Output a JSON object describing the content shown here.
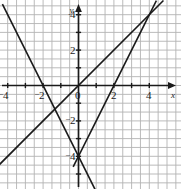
{
  "chart_data": {
    "type": "line",
    "title": "",
    "xlabel": "x",
    "ylabel": "y",
    "xlim": [
      -5,
      5
    ],
    "ylim": [
      -5.6,
      4.6
    ],
    "grid": true,
    "grid_step": 0.5,
    "legend": "none",
    "x_ticks": [
      {
        "value": -4,
        "label": "4",
        "negative": true
      },
      {
        "value": -2,
        "label": "2",
        "negative": true
      },
      {
        "value": 0,
        "label": "0",
        "negative": false
      },
      {
        "value": 2,
        "label": "2",
        "negative": false
      },
      {
        "value": 4,
        "label": "4",
        "negative": false
      }
    ],
    "y_ticks": [
      {
        "value": 4,
        "label": "4",
        "negative": false
      },
      {
        "value": 2,
        "label": "2",
        "negative": false
      },
      {
        "value": -2,
        "label": "2",
        "negative": true
      },
      {
        "value": -4,
        "label": "4",
        "negative": true
      }
    ],
    "series": [
      {
        "name": "line-slope-negative-two",
        "equation": "y = -2x - 4",
        "slope": -2,
        "intercept": -4,
        "points": [
          [
            -4.3,
            4.6
          ],
          [
            1.0,
            -6.0
          ]
        ],
        "color": "#1a1a1a"
      },
      {
        "name": "line-slope-two",
        "equation": "y = 2x - 4",
        "slope": 2,
        "intercept": -4,
        "points": [
          [
            -0.3,
            -4.6
          ],
          [
            4.4,
            4.8
          ]
        ],
        "color": "#1a1a1a"
      },
      {
        "name": "line-slope-one",
        "equation": "y = x",
        "slope": 1,
        "intercept": 0,
        "points": [
          [
            -4.6,
            -4.6
          ],
          [
            4.8,
            4.8
          ]
        ],
        "color": "#1a1a1a"
      }
    ],
    "intersections": [
      {
        "x": 0,
        "y": -4,
        "lines": [
          "line-slope-negative-two",
          "line-slope-two"
        ]
      },
      {
        "x": 3,
        "y": 2,
        "lines": [
          "line-slope-two",
          "line-slope-one"
        ]
      },
      {
        "x": -1.333,
        "y": -1.333,
        "lines": [
          "line-slope-negative-two",
          "line-slope-one"
        ]
      }
    ],
    "colors": {
      "grid": "#b3b3b3",
      "axis": "#1a1a1a",
      "line": "#1a1a1a",
      "background": "#ffffff"
    }
  },
  "axis_labels": {
    "x_name": "x",
    "y_name": "y"
  }
}
